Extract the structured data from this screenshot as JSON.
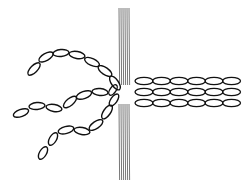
{
  "diagram": {
    "colors": {
      "stroke": "#111111",
      "barrier": "#555555",
      "background": "#ffffff"
    },
    "barrier": {
      "x_start": 119,
      "line_count": 6,
      "spacing": 2,
      "upper": {
        "y1": 8,
        "y2": 85
      },
      "lower": {
        "y1": 104,
        "y2": 180
      }
    },
    "left_chains": [
      {
        "name": "upper-curved-chain",
        "beads": [
          [
            34,
            69,
            8,
            3.5,
            -45
          ],
          [
            46,
            57,
            8,
            3.5,
            -30
          ],
          [
            61,
            53,
            8,
            3.5,
            -5
          ],
          [
            77,
            55,
            8,
            3.5,
            10
          ],
          [
            92,
            62,
            8,
            3.5,
            25
          ],
          [
            105,
            71,
            8,
            3.5,
            35
          ],
          [
            115,
            83,
            8,
            3.5,
            55
          ]
        ]
      },
      {
        "name": "middle-curved-chain",
        "beads": [
          [
            21,
            113,
            8,
            3.5,
            -20
          ],
          [
            37,
            106,
            8,
            3.5,
            -5
          ],
          [
            54,
            108,
            8,
            3.5,
            10
          ],
          [
            70,
            102,
            8,
            3.5,
            -40
          ],
          [
            84,
            95,
            8,
            3.5,
            -20
          ],
          [
            100,
            92,
            8,
            3.5,
            5
          ],
          [
            113,
            90,
            6,
            3,
            -55
          ]
        ]
      },
      {
        "name": "lower-curved-chain",
        "beads": [
          [
            43,
            153,
            7,
            3.5,
            -60
          ],
          [
            53,
            139,
            7,
            3.5,
            -60
          ],
          [
            66,
            130,
            8,
            3.5,
            -15
          ],
          [
            82,
            131,
            8,
            3.5,
            10
          ],
          [
            96,
            125,
            8,
            3.5,
            -35
          ],
          [
            107,
            112,
            8,
            3.5,
            -55
          ],
          [
            114,
            100,
            7,
            3.2,
            -55
          ]
        ]
      }
    ],
    "right_chains": [
      {
        "name": "top-straight-chain",
        "y": 81,
        "x_start": 144,
        "count": 6,
        "step": 17.5,
        "rx": 9,
        "ry": 3.6
      },
      {
        "name": "middle-straight-chain",
        "y": 92,
        "x_start": 144,
        "count": 6,
        "step": 17.5,
        "rx": 9,
        "ry": 3.6
      },
      {
        "name": "bottom-straight-chain",
        "y": 103,
        "x_start": 144,
        "count": 6,
        "step": 17.5,
        "rx": 9,
        "ry": 3.6
      }
    ]
  }
}
